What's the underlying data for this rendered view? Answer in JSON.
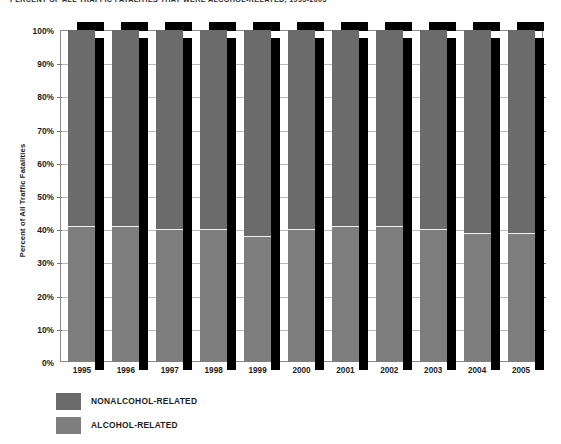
{
  "chart_data": {
    "type": "bar",
    "subtype": "stacked-100-percent",
    "title": "PERCENT OF ALL TRAFFIC FATALITIES THAT WERE ALCOHOL-RELATED, 1995-2005",
    "xlabel": "",
    "ylabel": "Percent of All Traffic Fatalities",
    "ylim": [
      0,
      100
    ],
    "ytick_labels": [
      "100%",
      "90%",
      "80%",
      "70%",
      "60%",
      "50%",
      "40%",
      "30%",
      "20%",
      "10%",
      "0%"
    ],
    "ytick_values": [
      100,
      90,
      80,
      70,
      60,
      50,
      40,
      30,
      20,
      10,
      0
    ],
    "grid": true,
    "legend_position": "bottom-left",
    "categories": [
      "1995",
      "1996",
      "1997",
      "1998",
      "1999",
      "2000",
      "2001",
      "2002",
      "2003",
      "2004",
      "2005"
    ],
    "series": [
      {
        "name": "NONALCOHOL-RELATED",
        "color": "#6b6b6b",
        "values": [
          59,
          59,
          60,
          60,
          62,
          60,
          59,
          59,
          60,
          61,
          61
        ]
      },
      {
        "name": "ALCOHOL-RELATED",
        "color": "#7e7e7e",
        "values": [
          41,
          41,
          40,
          40,
          38,
          40,
          41,
          41,
          40,
          39,
          39
        ]
      }
    ]
  },
  "legend": {
    "items": [
      {
        "label": "NONALCOHOL-RELATED",
        "color": "#6b6b6b"
      },
      {
        "label": "ALCOHOL-RELATED",
        "color": "#7e7e7e"
      }
    ]
  },
  "colors": {
    "nonalcohol": "#6b6b6b",
    "alcohol": "#7e7e7e",
    "shadow": "#000000",
    "axis": "#8a8a8a",
    "gridline": "#b9b9b9",
    "text": "#1c1c1c",
    "background": "#ffffff"
  }
}
